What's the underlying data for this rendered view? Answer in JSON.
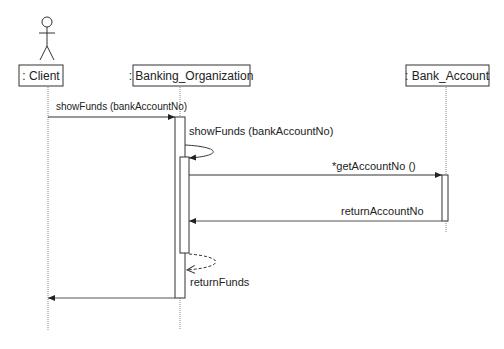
{
  "diagram": {
    "type": "sequence",
    "actor": {
      "name": "client-actor"
    },
    "lifelines": [
      {
        "id": "client",
        "label": ": Client"
      },
      {
        "id": "bank_org",
        "label": ": Banking_Organization"
      },
      {
        "id": "bank_account",
        "label": ": Bank_Account"
      }
    ],
    "messages": [
      {
        "id": "m1",
        "from": "client",
        "to": "bank_org",
        "label": "showFunds (bankAccountNo)",
        "kind": "sync"
      },
      {
        "id": "m2",
        "from": "bank_org",
        "to": "bank_org",
        "label": "showFunds (bankAccountNo)",
        "kind": "self-call"
      },
      {
        "id": "m3",
        "from": "bank_org",
        "to": "bank_account",
        "label": "*getAccountNo ()",
        "kind": "sync"
      },
      {
        "id": "m4",
        "from": "bank_account",
        "to": "bank_org",
        "label": "returnAccountNo",
        "kind": "return"
      },
      {
        "id": "m5",
        "from": "bank_org",
        "to": "bank_org",
        "label": "returnFunds",
        "kind": "self-return"
      },
      {
        "id": "m6",
        "from": "bank_org",
        "to": "client",
        "label": "",
        "kind": "return"
      }
    ],
    "colors": {
      "line": "#333333",
      "lifeline": "#888888",
      "background": "#ffffff"
    }
  }
}
